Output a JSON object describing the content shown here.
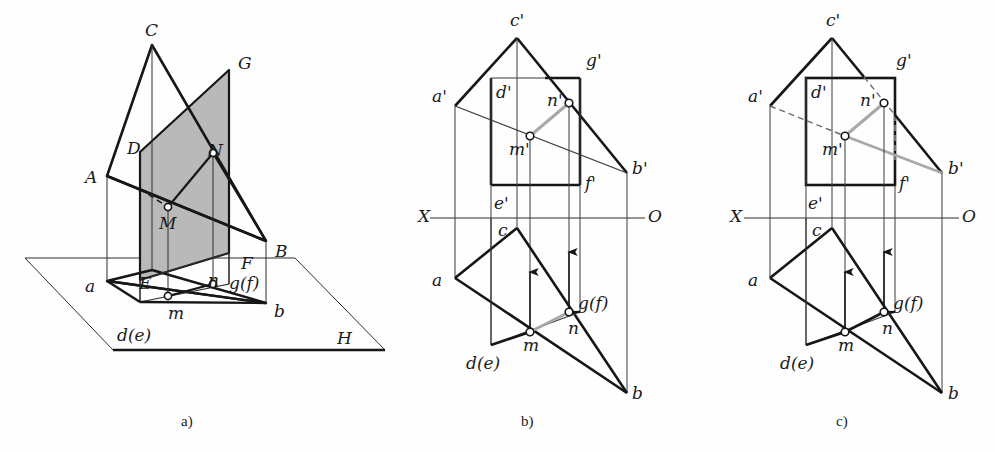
{
  "figure": {
    "panels": [
      {
        "id": "a",
        "caption": "a)",
        "caption_x": 181,
        "caption_y": 414,
        "description": "pictorial (axonometric) view with horizontal plane H"
      },
      {
        "id": "b",
        "caption": "b)",
        "caption_x": 521,
        "caption_y": 414,
        "description": "two-view projection, visibility case 1"
      },
      {
        "id": "c",
        "caption": "c)",
        "caption_x": 836,
        "caption_y": 414,
        "description": "two-view projection, visibility case 2"
      }
    ]
  },
  "colors": {
    "line": "#161616",
    "thin": "#3a3a3a",
    "gray_highlight": "#a8a8a8",
    "fill_gray": "#b9b9b9",
    "paper": "#fefefe"
  },
  "panel_a": {
    "labels": [
      {
        "name": "label-C",
        "text": "C",
        "x": 145,
        "y": 22
      },
      {
        "name": "label-G",
        "text": "G",
        "x": 238,
        "y": 55
      },
      {
        "name": "label-D",
        "text": "D",
        "x": 127,
        "y": 140
      },
      {
        "name": "label-N",
        "text": "N",
        "x": 208,
        "y": 142
      },
      {
        "name": "label-A",
        "text": "A",
        "x": 85,
        "y": 169
      },
      {
        "name": "label-M",
        "text": "M",
        "x": 159,
        "y": 215
      },
      {
        "name": "label-B",
        "text": "B",
        "x": 275,
        "y": 243
      },
      {
        "name": "label-F",
        "text": "F",
        "x": 241,
        "y": 255
      },
      {
        "name": "label-a",
        "text": "a",
        "x": 85,
        "y": 278
      },
      {
        "name": "label-E",
        "text": "E",
        "x": 139,
        "y": 275
      },
      {
        "name": "label-n",
        "text": "n",
        "x": 208,
        "y": 272
      },
      {
        "name": "label-gf",
        "text": "g(f)",
        "x": 229,
        "y": 275
      },
      {
        "name": "label-m",
        "text": "m",
        "x": 168,
        "y": 305
      },
      {
        "name": "label-b",
        "text": "b",
        "x": 274,
        "y": 303
      },
      {
        "name": "label-de",
        "text": "d(e)",
        "x": 117,
        "y": 327
      },
      {
        "name": "label-H",
        "text": "H",
        "x": 337,
        "y": 330
      }
    ]
  },
  "panel_b": {
    "labels": [
      {
        "name": "label-c-prime",
        "text": "c'",
        "x": 510,
        "y": 12
      },
      {
        "name": "label-g-prime",
        "text": "g'",
        "x": 586,
        "y": 52
      },
      {
        "name": "label-a-prime",
        "text": "a'",
        "x": 432,
        "y": 88
      },
      {
        "name": "label-d-prime",
        "text": "d'",
        "x": 496,
        "y": 84
      },
      {
        "name": "label-n-prime",
        "text": "n'",
        "x": 547,
        "y": 92
      },
      {
        "name": "label-m-prime",
        "text": "m'",
        "x": 509,
        "y": 141
      },
      {
        "name": "label-b-prime",
        "text": "b'",
        "x": 632,
        "y": 160
      },
      {
        "name": "label-f-prime",
        "text": "f'",
        "x": 585,
        "y": 175
      },
      {
        "name": "label-e-prime",
        "text": "e'",
        "x": 494,
        "y": 195
      },
      {
        "name": "label-X",
        "text": "X",
        "x": 418,
        "y": 208
      },
      {
        "name": "label-O",
        "text": "O",
        "x": 648,
        "y": 208
      },
      {
        "name": "label-c",
        "text": "c",
        "x": 498,
        "y": 222
      },
      {
        "name": "label-a",
        "text": "a",
        "x": 432,
        "y": 272
      },
      {
        "name": "label-gf",
        "text": "g(f)",
        "x": 578,
        "y": 295
      },
      {
        "name": "label-n",
        "text": "n",
        "x": 568,
        "y": 320
      },
      {
        "name": "label-m",
        "text": "m",
        "x": 523,
        "y": 337
      },
      {
        "name": "label-de",
        "text": "d(e)",
        "x": 466,
        "y": 355
      },
      {
        "name": "label-b",
        "text": "b",
        "x": 632,
        "y": 385
      }
    ]
  },
  "panel_c": {
    "labels": [
      {
        "name": "label-c-prime",
        "text": "c'",
        "x": 826,
        "y": 12
      },
      {
        "name": "label-g-prime",
        "text": "g'",
        "x": 896,
        "y": 52
      },
      {
        "name": "label-a-prime",
        "text": "a'",
        "x": 748,
        "y": 88
      },
      {
        "name": "label-d-prime",
        "text": "d'",
        "x": 811,
        "y": 84
      },
      {
        "name": "label-n-prime",
        "text": "n'",
        "x": 860,
        "y": 92
      },
      {
        "name": "label-m-prime",
        "text": "m'",
        "x": 822,
        "y": 141
      },
      {
        "name": "label-b-prime",
        "text": "b'",
        "x": 948,
        "y": 160
      },
      {
        "name": "label-f-prime",
        "text": "f'",
        "x": 899,
        "y": 175
      },
      {
        "name": "label-e-prime",
        "text": "e'",
        "x": 808,
        "y": 195
      },
      {
        "name": "label-X",
        "text": "X",
        "x": 730,
        "y": 208
      },
      {
        "name": "label-O",
        "text": "O",
        "x": 962,
        "y": 208
      },
      {
        "name": "label-c",
        "text": "c",
        "x": 812,
        "y": 222
      },
      {
        "name": "label-a",
        "text": "a",
        "x": 748,
        "y": 272
      },
      {
        "name": "label-gf",
        "text": "g(f)",
        "x": 893,
        "y": 295
      },
      {
        "name": "label-n",
        "text": "n",
        "x": 882,
        "y": 320
      },
      {
        "name": "label-m",
        "text": "m",
        "x": 838,
        "y": 337
      },
      {
        "name": "label-de",
        "text": "d(e)",
        "x": 780,
        "y": 355
      },
      {
        "name": "label-b",
        "text": "b",
        "x": 948,
        "y": 385
      }
    ]
  },
  "geometry": {
    "panel_a": {
      "H_plane": [
        [
          25,
          258
        ],
        [
          113,
          350
        ],
        [
          385,
          350
        ],
        [
          295,
          258
        ]
      ],
      "A": [
        107,
        176
      ],
      "B": [
        266,
        241
      ],
      "C": [
        152,
        45
      ],
      "a": [
        107,
        281
      ],
      "b": [
        266,
        303
      ],
      "c_ground": [
        152,
        270
      ],
      "D": [
        140,
        152
      ],
      "G": [
        229,
        70
      ],
      "E": [
        140,
        280
      ],
      "F": [
        229,
        253
      ],
      "M": [
        168,
        207
      ],
      "N": [
        213,
        153
      ],
      "m": [
        168,
        296
      ],
      "n": [
        213,
        284
      ]
    },
    "panel_b": {
      "a_prime": [
        455,
        106
      ],
      "b_prime": [
        627,
        173
      ],
      "c_prime": [
        517,
        38
      ],
      "d_prime": [
        491,
        78
      ],
      "g_prime": [
        580,
        78
      ],
      "e_prime": [
        491,
        185
      ],
      "f_prime": [
        580,
        185
      ],
      "m_prime": [
        530,
        136
      ],
      "n_prime": [
        569,
        103
      ],
      "a": [
        455,
        278
      ],
      "b": [
        627,
        393
      ],
      "c": [
        517,
        228
      ],
      "d": [
        491,
        345
      ],
      "g": [
        580,
        312
      ],
      "m": [
        530,
        332
      ],
      "n": [
        569,
        312
      ],
      "axis_y": 218,
      "axis_x1": 430,
      "axis_x2": 645
    },
    "panel_c": {
      "a_prime": [
        770,
        106
      ],
      "b_prime": [
        942,
        173
      ],
      "c_prime": [
        832,
        38
      ],
      "d_prime": [
        806,
        78
      ],
      "g_prime": [
        895,
        78
      ],
      "e_prime": [
        806,
        185
      ],
      "f_prime": [
        895,
        185
      ],
      "m_prime": [
        845,
        136
      ],
      "n_prime": [
        884,
        103
      ],
      "a": [
        770,
        278
      ],
      "b": [
        942,
        393
      ],
      "c": [
        832,
        228
      ],
      "d": [
        806,
        345
      ],
      "g": [
        895,
        312
      ],
      "m": [
        845,
        332
      ],
      "n": [
        884,
        312
      ],
      "axis_y": 218,
      "axis_x1": 744,
      "axis_x2": 959
    }
  }
}
